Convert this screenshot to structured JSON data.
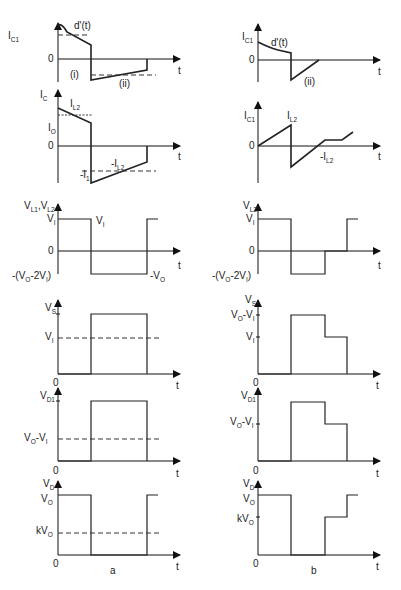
{
  "figure": {
    "captions": {
      "left": "a",
      "right": "b"
    },
    "time_label": "t",
    "zero_label": "0"
  },
  "panels": {
    "left": [
      {
        "id": "ic1-a",
        "ylabel": "I",
        "ylabel_sub": "C1",
        "level_labels": [
          {
            "text": "I",
            "sub": "C1",
            "y": 35
          }
        ],
        "annotations": [
          {
            "text": "d'(t)",
            "x": 75,
            "y": 20
          },
          {
            "text": "(i)",
            "x": 62,
            "y": 75
          },
          {
            "text": "(ii)",
            "x": 117,
            "y": 81
          }
        ]
      },
      {
        "id": "ic-a",
        "ylabel": "I",
        "ylabel_sub": "C",
        "level_labels": [
          {
            "text": "I",
            "sub": "O",
            "y": 127
          },
          {
            "text": "-I",
            "sub": "1",
            "y": 173
          }
        ],
        "annotations": [
          {
            "text": "I",
            "sub": "L2",
            "x": 70,
            "y": 108
          },
          {
            "text": "-I",
            "sub": "L2",
            "x": 111,
            "y": 166
          }
        ]
      },
      {
        "id": "vl-a",
        "ylabel": "V",
        "ylabel_sub": "L1",
        "ylabel2": ",V",
        "ylabel2_sub": "L2",
        "level_labels": [
          {
            "text": "V",
            "sub": "I",
            "y": 222
          },
          {
            "text": "-(V",
            "sub": "O",
            "tail": "-2V",
            "tail_sub": "I",
            "tail_end": ")",
            "y": 276
          }
        ],
        "annotations": [
          {
            "text": "V",
            "sub": "I",
            "x": 96,
            "y": 222
          },
          {
            "text": "-V",
            "sub": "O",
            "x": 148,
            "y": 276
          }
        ]
      },
      {
        "id": "vs-a",
        "ylabel": "V",
        "ylabel_sub": "S",
        "level_labels": [
          {
            "text": "V",
            "sub": "I",
            "y": 340
          }
        ]
      },
      {
        "id": "vd1-a",
        "ylabel": "V",
        "ylabel_sub": "D1",
        "level_labels": [
          {
            "text": "V",
            "sub": "O",
            "tail": "-V",
            "tail_sub": "I",
            "y": 441
          }
        ]
      },
      {
        "id": "vd-a",
        "ylabel": "V",
        "ylabel_sub": "D",
        "level_labels": [
          {
            "text": "V",
            "sub": "O",
            "y": 502
          },
          {
            "text": "kV",
            "sub": "O",
            "y": 534
          }
        ]
      }
    ],
    "right": [
      {
        "id": "ic1-b",
        "ylabel": "I",
        "ylabel_sub": "C1",
        "annotations": [
          {
            "text": "d'(t)",
            "x": 271,
            "y": 46
          },
          {
            "text": "(ii)",
            "x": 303,
            "y": 84
          }
        ]
      },
      {
        "id": "ic1-b2",
        "ylabel": "I",
        "ylabel_sub": "C1",
        "annotations": [
          {
            "text": "I",
            "sub": "L2",
            "x": 287,
            "y": 118
          },
          {
            "text": "-I",
            "sub": "L2",
            "x": 320,
            "y": 160
          }
        ]
      },
      {
        "id": "vl2-b",
        "ylabel": "V",
        "ylabel_sub": "L2",
        "level_labels": [
          {
            "text": "V",
            "sub": "I",
            "y": 222
          },
          {
            "text": "-(V",
            "sub": "O",
            "tail": "-2V",
            "tail_sub": "I",
            "tail_end": ")",
            "y": 276
          }
        ]
      },
      {
        "id": "vs-b",
        "ylabel": "V",
        "ylabel_sub": "S",
        "level_labels": [
          {
            "text": "V",
            "sub": "O",
            "tail": "-V",
            "tail_sub": "I",
            "y": 318
          },
          {
            "text": "V",
            "sub": "I",
            "y": 340
          }
        ]
      },
      {
        "id": "vd1-b",
        "ylabel": "V",
        "ylabel_sub": "D1",
        "level_labels": [
          {
            "text": "V",
            "sub": "O",
            "tail": "-V",
            "tail_sub": "I",
            "y": 425
          }
        ]
      },
      {
        "id": "vd-b",
        "ylabel": "V",
        "ylabel_sub": "D",
        "level_labels": [
          {
            "text": "V",
            "sub": "O",
            "y": 502
          },
          {
            "text": "kV",
            "sub": "O",
            "y": 522
          }
        ]
      }
    ]
  }
}
